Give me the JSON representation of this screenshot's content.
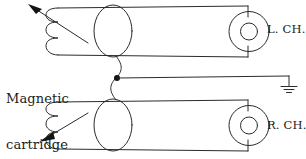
{
  "diagram": {
    "title_text": "Magnetic cartridge",
    "labels": {
      "cartridge_line1": "Magnetic",
      "cartridge_line2": "cartridge",
      "left_channel": "L. CH.",
      "right_channel": "R. CH."
    },
    "colors": {
      "background": "#ffffff",
      "line": "#2b2b2b",
      "text": "#1a1a1a",
      "junction_dot": "#141414"
    },
    "components": {
      "channels": [
        {
          "id": "left",
          "label": "L. CH.",
          "coil_turns": 3,
          "magnet_shape": "ellipse",
          "transducer": "concentric-circles",
          "arrow_direction": "up-left"
        },
        {
          "id": "right",
          "label": "R. CH.",
          "coil_turns": 3,
          "magnet_shape": "ellipse",
          "transducer": "concentric-circles",
          "arrow_direction": "down-left"
        }
      ],
      "junction": {
        "name": "common-ground-junction",
        "marker": "filled-dot"
      },
      "ground": {
        "name": "ground-symbol",
        "bars": 3
      }
    }
  }
}
